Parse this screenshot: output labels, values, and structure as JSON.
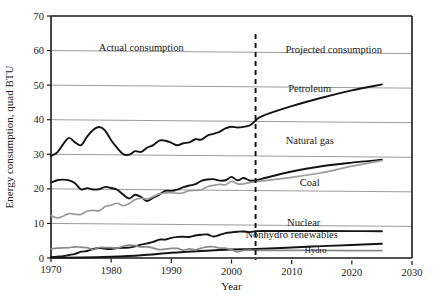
{
  "chart_data": {
    "type": "line",
    "title": "",
    "xlabel": "Year",
    "ylabel": "Energy consumption, quad BTU",
    "xlim": [
      1970,
      2030
    ],
    "ylim": [
      0,
      70
    ],
    "xticks": [
      1970,
      1980,
      1990,
      2000,
      2010,
      2020,
      2030
    ],
    "yticks": [
      0,
      10,
      20,
      30,
      40,
      50,
      60,
      70
    ],
    "grid": true,
    "legend_position": "inline-labels",
    "annotations": [
      {
        "text": "Actual consumption",
        "x": 1985,
        "y": 60
      },
      {
        "text": "Projected consumption",
        "x": 2017,
        "y": 60
      }
    ],
    "divider": {
      "x": 2004,
      "style": "dashed",
      "color": "#111111"
    },
    "series": [
      {
        "name": "Petroleum",
        "color": "#141414",
        "label_x": 2013,
        "label_y": 48.5,
        "x": [
          1970,
          1971,
          1972,
          1973,
          1974,
          1975,
          1976,
          1977,
          1978,
          1979,
          1980,
          1981,
          1982,
          1983,
          1984,
          1985,
          1986,
          1987,
          1988,
          1989,
          1990,
          1991,
          1992,
          1993,
          1994,
          1995,
          1996,
          1997,
          1998,
          1999,
          2000,
          2001,
          2002,
          2003,
          2004,
          2005,
          2010,
          2015,
          2020,
          2025
        ],
        "y": [
          29.5,
          30.5,
          32.9,
          34.8,
          33.5,
          32.7,
          35.2,
          37.1,
          38.0,
          37.0,
          34.2,
          32.0,
          30.2,
          30.1,
          31.1,
          30.9,
          32.2,
          32.9,
          34.2,
          34.2,
          33.6,
          32.9,
          33.5,
          33.8,
          34.7,
          34.6,
          35.8,
          36.3,
          36.9,
          37.9,
          38.4,
          38.2,
          38.4,
          38.8,
          40.2,
          41.5,
          44.5,
          47.0,
          49.2,
          51.0
        ]
      },
      {
        "name": "Natural gas",
        "color": "#141414",
        "label_x": 2013,
        "label_y": 33.5,
        "x": [
          1970,
          1971,
          1972,
          1973,
          1974,
          1975,
          1976,
          1977,
          1978,
          1979,
          1980,
          1981,
          1982,
          1983,
          1984,
          1985,
          1986,
          1987,
          1988,
          1989,
          1990,
          1991,
          1992,
          1993,
          1994,
          1995,
          1996,
          1997,
          1998,
          1999,
          2000,
          2001,
          2002,
          2003,
          2004,
          2005,
          2010,
          2015,
          2020,
          2025
        ],
        "y": [
          21.8,
          22.5,
          22.7,
          22.5,
          21.7,
          19.9,
          20.3,
          19.9,
          20.0,
          20.7,
          20.4,
          19.9,
          18.5,
          17.4,
          18.5,
          17.8,
          16.7,
          17.7,
          18.6,
          19.7,
          19.7,
          20.1,
          20.8,
          21.3,
          21.7,
          22.7,
          23.1,
          23.2,
          22.8,
          22.9,
          23.9,
          22.9,
          23.6,
          22.9,
          22.9,
          23.4,
          25.6,
          27.2,
          28.3,
          29.2
        ]
      },
      {
        "name": "Coal",
        "color": "#9a9a9a",
        "label_x": 2013,
        "label_y": 21.5,
        "x": [
          1970,
          1971,
          1972,
          1973,
          1974,
          1975,
          1976,
          1977,
          1978,
          1979,
          1980,
          1981,
          1982,
          1983,
          1984,
          1985,
          1986,
          1987,
          1988,
          1989,
          1990,
          1991,
          1992,
          1993,
          1994,
          1995,
          1996,
          1997,
          1998,
          1999,
          2000,
          2001,
          2002,
          2003,
          2004,
          2005,
          2010,
          2015,
          2020,
          2025
        ],
        "y": [
          12.3,
          11.6,
          12.1,
          12.9,
          12.7,
          12.7,
          13.6,
          13.9,
          13.8,
          15.0,
          15.4,
          16.0,
          15.3,
          15.9,
          17.1,
          17.5,
          17.3,
          18.0,
          18.8,
          19.1,
          19.2,
          19.0,
          19.2,
          19.8,
          19.9,
          20.1,
          21.0,
          21.4,
          21.7,
          21.6,
          22.6,
          21.9,
          21.9,
          22.3,
          22.5,
          22.8,
          23.9,
          25.3,
          27.3,
          29.0
        ]
      },
      {
        "name": "Nuclear",
        "color": "#141414",
        "label_x": 2012,
        "label_y": 9.8,
        "x": [
          1970,
          1971,
          1972,
          1973,
          1974,
          1975,
          1976,
          1977,
          1978,
          1979,
          1980,
          1981,
          1982,
          1983,
          1984,
          1985,
          1986,
          1987,
          1988,
          1989,
          1990,
          1991,
          1992,
          1993,
          1994,
          1995,
          1996,
          1997,
          1998,
          1999,
          2000,
          2001,
          2002,
          2003,
          2004,
          2005,
          2010,
          2015,
          2020,
          2025
        ],
        "y": [
          0.24,
          0.41,
          0.58,
          0.91,
          1.27,
          1.9,
          2.11,
          2.7,
          3.02,
          2.78,
          2.74,
          3.01,
          3.13,
          3.2,
          3.55,
          4.08,
          4.47,
          4.91,
          5.59,
          5.6,
          6.1,
          6.42,
          6.48,
          6.41,
          6.84,
          7.08,
          7.17,
          6.6,
          7.07,
          7.61,
          7.86,
          8.03,
          8.14,
          7.96,
          8.22,
          8.3,
          8.4,
          8.45,
          8.5,
          8.55
        ]
      },
      {
        "name": "Nonhydro renewables",
        "color": "#141414",
        "label_x": 2010,
        "label_y": 6.4,
        "x": [
          1970,
          1975,
          1980,
          1985,
          1990,
          1995,
          2000,
          2004,
          2010,
          2015,
          2020,
          2025
        ],
        "y": [
          0.1,
          0.2,
          0.5,
          1.0,
          1.8,
          2.4,
          2.9,
          3.1,
          3.6,
          4.1,
          4.5,
          4.9
        ]
      },
      {
        "name": "Hydro",
        "color": "#8a8a8a",
        "label_x": 2014,
        "label_y": 2.0,
        "x": [
          1970,
          1971,
          1972,
          1973,
          1974,
          1975,
          1976,
          1977,
          1978,
          1979,
          1980,
          1981,
          1982,
          1983,
          1984,
          1985,
          1986,
          1987,
          1988,
          1989,
          1990,
          1991,
          1992,
          1993,
          1994,
          1995,
          1996,
          1997,
          1998,
          1999,
          2000,
          2001,
          2002,
          2003,
          2004,
          2005,
          2010,
          2015,
          2020,
          2025
        ],
        "y": [
          2.65,
          2.85,
          2.95,
          3.01,
          3.3,
          3.2,
          3.08,
          2.52,
          3.15,
          3.15,
          3.12,
          3.0,
          3.57,
          3.9,
          3.77,
          3.4,
          3.44,
          3.12,
          2.66,
          2.86,
          3.05,
          3.07,
          2.62,
          2.95,
          2.7,
          3.21,
          3.59,
          3.64,
          3.3,
          3.27,
          2.81,
          2.24,
          2.69,
          2.78,
          2.69,
          2.72,
          2.8,
          2.85,
          2.88,
          2.9
        ]
      }
    ]
  },
  "plot": {
    "left_px": 51,
    "right_px": 412,
    "top_px": 16,
    "bottom_px": 258
  },
  "labels": {
    "actual_consumption": "Actual consumption",
    "projected_consumption": "Projected consumption",
    "petroleum": "Petroleum",
    "natural_gas": "Natural gas",
    "coal": "Coal",
    "nuclear": "Nuclear",
    "nonhydro_renewables": "Nonhydro renewables",
    "hydro": "Hydro",
    "x_axis_title": "Year",
    "y_axis_title": "Energy consumption, quad BTU",
    "tick_1970": "1970",
    "tick_1980": "1980",
    "tick_1990": "1990",
    "tick_2000": "2000",
    "tick_2010": "2010",
    "tick_2020": "2020",
    "tick_2030": "2030",
    "tick_0": "0",
    "tick_10": "10",
    "tick_20": "20",
    "tick_30": "30",
    "tick_40": "40",
    "tick_50": "50",
    "tick_60": "60",
    "tick_70": "70"
  },
  "colors": {
    "axis": "#1a1a1a",
    "grid": "#9b9b9b",
    "dark_series": "#141414",
    "gray_series": "#9a9a9a",
    "background": "#ffffff"
  }
}
